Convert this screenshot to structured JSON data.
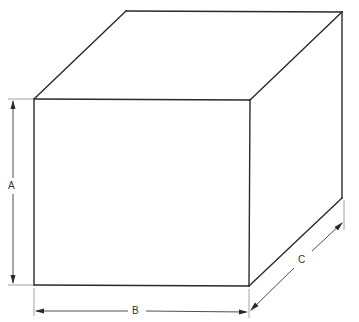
{
  "diagram": {
    "type": "box-dimension-drawing",
    "labels": {
      "height": "A",
      "width": "B",
      "depth": "C"
    },
    "colors": {
      "line": "#2a2a2a",
      "background": "#ffffff"
    }
  }
}
